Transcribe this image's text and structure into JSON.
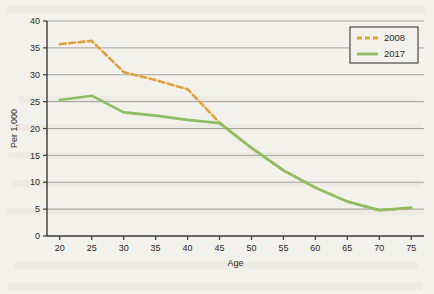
{
  "chart_data": {
    "type": "line",
    "title": "",
    "xlabel": "Age",
    "ylabel": "Per 1,000",
    "xlim": [
      18,
      77
    ],
    "ylim": [
      0,
      40
    ],
    "xticks": [
      20,
      25,
      30,
      35,
      40,
      45,
      50,
      55,
      60,
      65,
      70,
      75
    ],
    "yticks": [
      0,
      5,
      10,
      15,
      20,
      25,
      30,
      35,
      40
    ],
    "grid": "horizontal",
    "legend_position": "top-right",
    "x": [
      20,
      25,
      30,
      35,
      40,
      45,
      50,
      55,
      60,
      65,
      70,
      75
    ],
    "series": [
      {
        "name": "2008",
        "color": "#E0A33C",
        "style": "dashed",
        "values": [
          35.7,
          36.3,
          30.5,
          29.0,
          27.3,
          21.1,
          16.4,
          12.2,
          9.0,
          6.4,
          4.8,
          5.2
        ]
      },
      {
        "name": "2017",
        "color": "#8CBE63",
        "style": "solid",
        "values": [
          25.3,
          26.1,
          23.0,
          22.4,
          21.6,
          21.0,
          16.4,
          12.2,
          9.0,
          6.4,
          4.8,
          5.3
        ]
      }
    ]
  },
  "axes": {
    "x_title": "Age",
    "y_title": "Per 1,000",
    "x_tick_labels": [
      "20",
      "25",
      "30",
      "35",
      "40",
      "45",
      "50",
      "55",
      "60",
      "65",
      "70",
      "75"
    ],
    "y_tick_labels": [
      "0",
      "5",
      "10",
      "15",
      "20",
      "25",
      "30",
      "35",
      "40"
    ]
  },
  "legend": {
    "entries": [
      {
        "label": "2008",
        "color": "#E0A33C",
        "style": "dashed"
      },
      {
        "label": "2017",
        "color": "#8CBE63",
        "style": "solid"
      }
    ]
  },
  "colors": {
    "series_2008": "#E0A33C",
    "series_2017": "#8CBE63",
    "grid": "#9a9a9a",
    "axis": "#3a3a3a",
    "background": "#f3f1ec"
  }
}
